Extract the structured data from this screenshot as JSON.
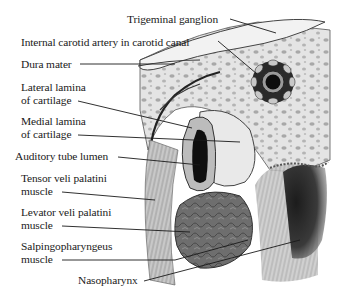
{
  "figure": {
    "labels": [
      {
        "id": "trigeminal-ganglion",
        "lines": [
          "Trigeminal ganglion"
        ]
      },
      {
        "id": "internal-carotid-artery",
        "lines": [
          "Internal carotid artery in carotid canal"
        ]
      },
      {
        "id": "dura-mater",
        "lines": [
          "Dura mater"
        ]
      },
      {
        "id": "lateral-lamina",
        "lines": [
          "Lateral lamina",
          "of cartilage"
        ]
      },
      {
        "id": "medial-lamina",
        "lines": [
          "Medial lamina",
          "of cartilage"
        ]
      },
      {
        "id": "auditory-tube-lumen",
        "lines": [
          "Auditory tube lumen"
        ]
      },
      {
        "id": "tensor-veli-palatini",
        "lines": [
          "Tensor veli palatini",
          "muscle"
        ]
      },
      {
        "id": "levator-veli-palatini",
        "lines": [
          "Levator veli palatini",
          "muscle"
        ]
      },
      {
        "id": "salpingopharyngeus",
        "lines": [
          "Salpingopharyngeus",
          "muscle"
        ]
      },
      {
        "id": "nasopharynx",
        "lines": [
          "Nasopharynx"
        ]
      }
    ]
  }
}
